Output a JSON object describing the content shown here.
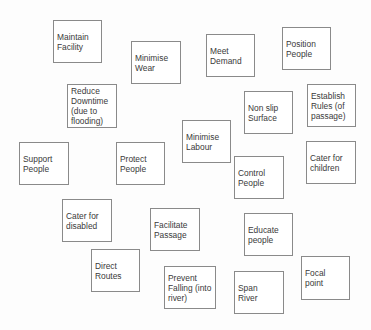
{
  "diagram": {
    "type": "affinity-cards",
    "nodes": [
      {
        "id": "maintain-facility",
        "lines": [
          "Maintain",
          "Facility"
        ],
        "x": 53,
        "y": 20,
        "w": 49,
        "h": 43
      },
      {
        "id": "minimise-wear",
        "lines": [
          "Minimise",
          "Wear"
        ],
        "x": 131,
        "y": 41,
        "w": 50,
        "h": 43
      },
      {
        "id": "meet-demand",
        "lines": [
          "Meet",
          "Demand"
        ],
        "x": 206,
        "y": 34,
        "w": 49,
        "h": 43
      },
      {
        "id": "position-people",
        "lines": [
          "Position",
          "People"
        ],
        "x": 282,
        "y": 27,
        "w": 49,
        "h": 43
      },
      {
        "id": "reduce-downtime",
        "lines": [
          "Reduce",
          "Downtime",
          "(due to",
          "flooding)"
        ],
        "x": 67,
        "y": 84,
        "w": 50,
        "h": 44
      },
      {
        "id": "non-slip-surface",
        "lines": [
          "Non slip",
          "Surface"
        ],
        "x": 244,
        "y": 91,
        "w": 49,
        "h": 43
      },
      {
        "id": "establish-rules",
        "lines": [
          "Establish",
          "Rules (of",
          "passage)"
        ],
        "x": 307,
        "y": 84,
        "w": 49,
        "h": 43
      },
      {
        "id": "minimise-labour",
        "lines": [
          "Minimise",
          "Labour"
        ],
        "x": 182,
        "y": 120,
        "w": 49,
        "h": 43
      },
      {
        "id": "support-people",
        "lines": [
          "Support",
          "People"
        ],
        "x": 19,
        "y": 142,
        "w": 50,
        "h": 43
      },
      {
        "id": "protect-people",
        "lines": [
          "Protect",
          "People"
        ],
        "x": 116,
        "y": 142,
        "w": 49,
        "h": 43
      },
      {
        "id": "cater-for-children",
        "lines": [
          "Cater for",
          "children"
        ],
        "x": 306,
        "y": 141,
        "w": 50,
        "h": 43
      },
      {
        "id": "control-people",
        "lines": [
          "Control",
          "People"
        ],
        "x": 234,
        "y": 156,
        "w": 50,
        "h": 43
      },
      {
        "id": "cater-for-disabled",
        "lines": [
          "Cater for",
          "disabled"
        ],
        "x": 62,
        "y": 199,
        "w": 50,
        "h": 43
      },
      {
        "id": "facilitate-passage",
        "lines": [
          "Facilitate",
          "Passage"
        ],
        "x": 150,
        "y": 208,
        "w": 50,
        "h": 43
      },
      {
        "id": "educate-people",
        "lines": [
          "Educate",
          "people"
        ],
        "x": 244,
        "y": 213,
        "w": 49,
        "h": 43
      },
      {
        "id": "direct-routes",
        "lines": [
          "Direct",
          "Routes"
        ],
        "x": 91,
        "y": 249,
        "w": 49,
        "h": 43
      },
      {
        "id": "prevent-falling",
        "lines": [
          "Prevent",
          "Falling (into",
          "river)"
        ],
        "x": 164,
        "y": 266,
        "w": 52,
        "h": 43
      },
      {
        "id": "span-river",
        "lines": [
          "Span",
          "River"
        ],
        "x": 234,
        "y": 271,
        "w": 50,
        "h": 43
      },
      {
        "id": "focal-point",
        "lines": [
          "Focal",
          "point"
        ],
        "x": 301,
        "y": 256,
        "w": 49,
        "h": 44
      }
    ]
  }
}
